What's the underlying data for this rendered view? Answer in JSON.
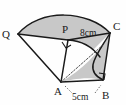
{
  "figure": {
    "kind": "geometry-diagram",
    "background_color": "#fefefe",
    "outline_color": "#1a1a1a",
    "shade_color": "#c8c8c8",
    "labels": {
      "q": "Q",
      "p": "P",
      "c": "C",
      "a": "A",
      "b": "B"
    },
    "measures": {
      "pc": "8cm",
      "ab": "5cm"
    },
    "right_angles": [
      {
        "at": "P",
        "name": "right-angle-at-p"
      },
      {
        "at": "B",
        "name": "right-angle-at-b"
      }
    ],
    "points": {
      "q": {
        "x": 18,
        "y": 34
      },
      "p": {
        "x": 68,
        "y": 40
      },
      "c": {
        "x": 110,
        "y": 33
      },
      "a": {
        "x": 61,
        "y": 82
      },
      "b": {
        "x": 103,
        "y": 80
      }
    }
  }
}
